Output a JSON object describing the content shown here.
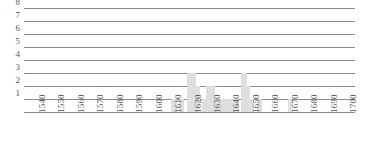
{
  "chart_data": {
    "type": "bar",
    "title": "",
    "subtitle": "",
    "xlabel": "",
    "ylabel": "",
    "grid": true,
    "legend": null,
    "orientation": "vertical",
    "bar_color": "#dedede",
    "axis_color": "#8c8c8c",
    "label_color": "#555555",
    "xlim": [
      1535,
      1705
    ],
    "ylim": [
      0,
      8
    ],
    "ytick_labels": [
      "8",
      "7",
      "6",
      "5",
      "4",
      "3",
      "2",
      "1"
    ],
    "ytick_values": [
      8,
      7,
      6,
      5,
      4,
      3,
      2,
      1
    ],
    "xtick_labels": [
      "1540",
      "1550",
      "1560",
      "1570",
      "1580",
      "1590",
      "1600",
      "1610",
      "1620",
      "1630",
      "1640",
      "1650",
      "1660",
      "1670",
      "1680",
      "1690",
      "1700"
    ],
    "xtick_values": [
      1540,
      1550,
      1560,
      1570,
      1580,
      1590,
      1600,
      1610,
      1620,
      1630,
      1640,
      1650,
      1660,
      1670,
      1680,
      1690,
      1700
    ],
    "xtick_rotation": 90,
    "x": [
      1612,
      1616,
      1620,
      1622,
      1624,
      1628,
      1630,
      1632,
      1634,
      1636,
      1638,
      1640,
      1642,
      1644,
      1648,
      1650,
      1652,
      1656,
      1672
    ],
    "values": [
      1,
      1,
      3,
      3,
      2,
      1,
      2,
      2,
      1,
      1,
      1,
      1,
      1,
      1,
      3,
      2,
      1,
      1,
      1
    ],
    "bars": [
      {
        "x": 1612,
        "value": 1
      },
      {
        "x": 1616,
        "value": 1
      },
      {
        "x": 1620,
        "value": 3
      },
      {
        "x": 1622,
        "value": 3
      },
      {
        "x": 1624,
        "value": 2
      },
      {
        "x": 1628,
        "value": 1
      },
      {
        "x": 1630,
        "value": 2
      },
      {
        "x": 1632,
        "value": 2
      },
      {
        "x": 1634,
        "value": 1
      },
      {
        "x": 1636,
        "value": 1
      },
      {
        "x": 1638,
        "value": 1
      },
      {
        "x": 1640,
        "value": 1
      },
      {
        "x": 1642,
        "value": 1
      },
      {
        "x": 1644,
        "value": 1
      },
      {
        "x": 1648,
        "value": 3
      },
      {
        "x": 1650,
        "value": 2
      },
      {
        "x": 1652,
        "value": 1
      },
      {
        "x": 1656,
        "value": 1
      },
      {
        "x": 1672,
        "value": 1
      }
    ]
  }
}
